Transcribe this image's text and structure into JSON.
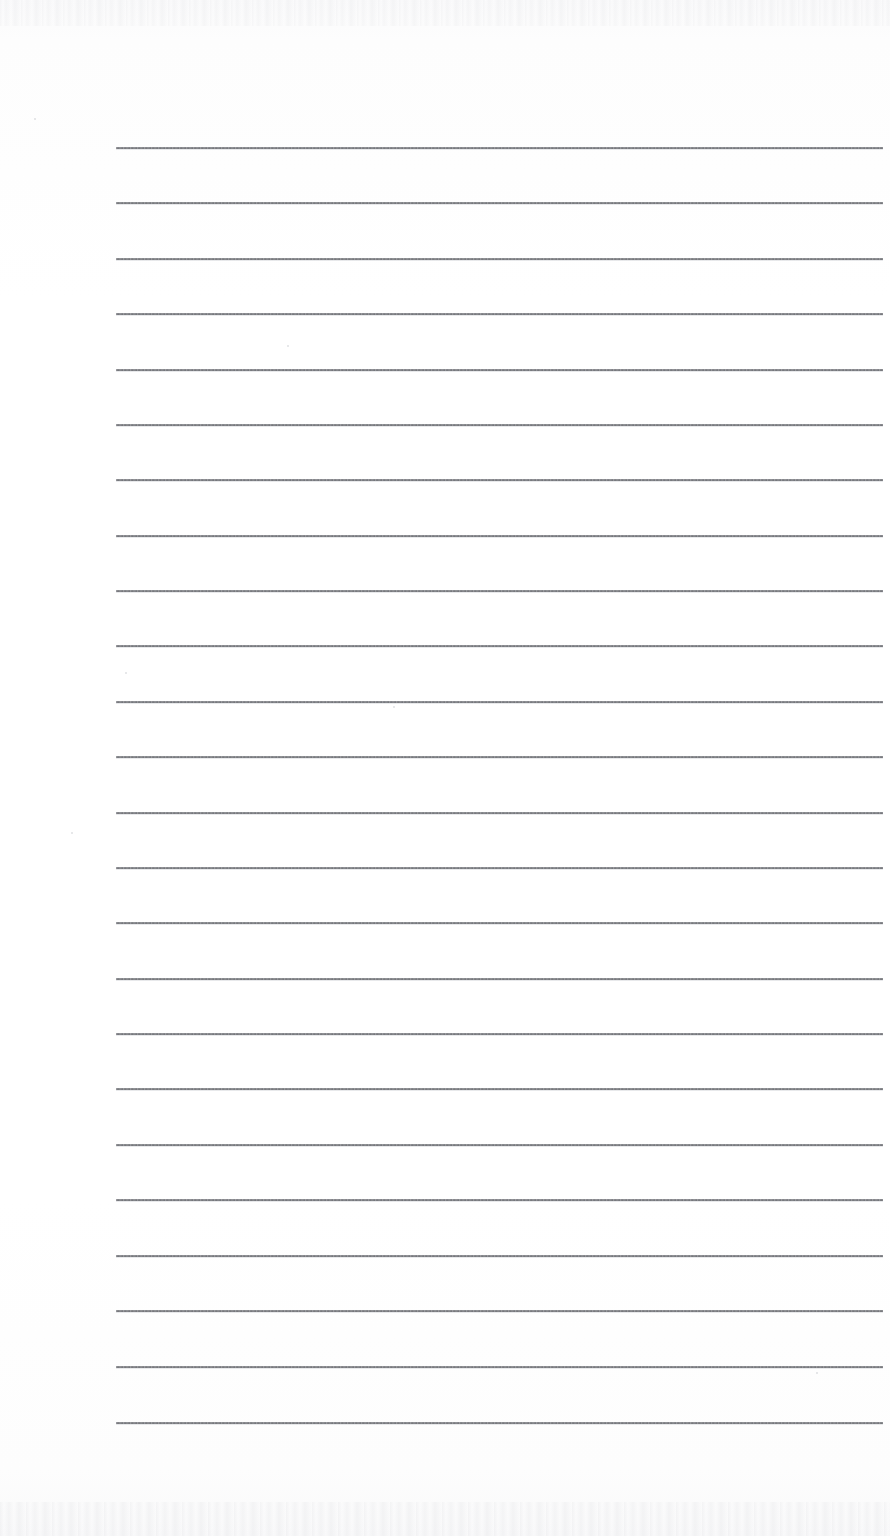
{
  "document": {
    "kind": "scanned-ruled-notepad-page",
    "title": "Blank Ruled Notepad Page",
    "page_width": 890,
    "page_height": 1536,
    "background_color": "#fdfdfd",
    "content_text": "",
    "has_handwriting": false,
    "has_printed_text": false
  },
  "ruling": {
    "line_color": "#4e5056",
    "line_thickness_px": 2,
    "line_left_x": 116,
    "line_right_x": 883,
    "line_width_px": 767,
    "first_line_y": 147,
    "last_line_y": 1422,
    "line_spacing_px": 55.43,
    "line_count": 24,
    "line_y_positions": [
      147,
      202,
      258,
      313,
      369,
      424,
      479,
      535,
      590,
      645,
      701,
      756,
      812,
      867,
      922,
      978,
      1033,
      1088,
      1144,
      1199,
      1255,
      1310,
      1366,
      1422
    ],
    "margin_left_px": 116,
    "margin_right_px": 7,
    "margin_top_px": 147,
    "margin_bottom_px": 114
  },
  "scan_artifacts": {
    "top_edge_noise": true,
    "bottom_edge_noise": true,
    "noise_color": "#a9abb1",
    "specks": [
      {
        "x": 34,
        "y": 118,
        "size": 2
      },
      {
        "x": 287,
        "y": 345,
        "size": 2
      },
      {
        "x": 125,
        "y": 672,
        "size": 2
      },
      {
        "x": 393,
        "y": 706,
        "size": 2
      },
      {
        "x": 71,
        "y": 832,
        "size": 2
      },
      {
        "x": 816,
        "y": 1372,
        "size": 2
      }
    ]
  },
  "rows": [
    {
      "index": 1,
      "text": ""
    },
    {
      "index": 2,
      "text": ""
    },
    {
      "index": 3,
      "text": ""
    },
    {
      "index": 4,
      "text": ""
    },
    {
      "index": 5,
      "text": ""
    },
    {
      "index": 6,
      "text": ""
    },
    {
      "index": 7,
      "text": ""
    },
    {
      "index": 8,
      "text": ""
    },
    {
      "index": 9,
      "text": ""
    },
    {
      "index": 10,
      "text": ""
    },
    {
      "index": 11,
      "text": ""
    },
    {
      "index": 12,
      "text": ""
    },
    {
      "index": 13,
      "text": ""
    },
    {
      "index": 14,
      "text": ""
    },
    {
      "index": 15,
      "text": ""
    },
    {
      "index": 16,
      "text": ""
    },
    {
      "index": 17,
      "text": ""
    },
    {
      "index": 18,
      "text": ""
    },
    {
      "index": 19,
      "text": ""
    },
    {
      "index": 20,
      "text": ""
    },
    {
      "index": 21,
      "text": ""
    },
    {
      "index": 22,
      "text": ""
    },
    {
      "index": 23,
      "text": ""
    }
  ]
}
